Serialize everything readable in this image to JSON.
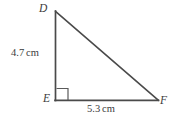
{
  "figure": {
    "kind": "right-triangle",
    "stroke_color": "#4a4a4a",
    "text_color": "#3b3b3b",
    "background_color": "#ffffff",
    "vertices": [
      {
        "name": "D",
        "label": "D",
        "x": 55,
        "y": 11
      },
      {
        "name": "E",
        "label": "E",
        "x": 55,
        "y": 100
      },
      {
        "name": "F",
        "label": "F",
        "x": 158,
        "y": 100
      }
    ],
    "right_angle_at": "E",
    "sides": [
      {
        "name": "DE",
        "value": "4.7",
        "unit": "cm",
        "label": "4.7 cm"
      },
      {
        "name": "EF",
        "value": "5.3",
        "unit": "cm",
        "label": "5.3 cm"
      }
    ]
  },
  "labels": {
    "vertex_d": "D",
    "vertex_e": "E",
    "vertex_f": "F",
    "leg_vertical_value": "4.7",
    "leg_vertical_unit": "cm",
    "leg_horizontal_value": "5.3",
    "leg_horizontal_unit": "cm"
  }
}
